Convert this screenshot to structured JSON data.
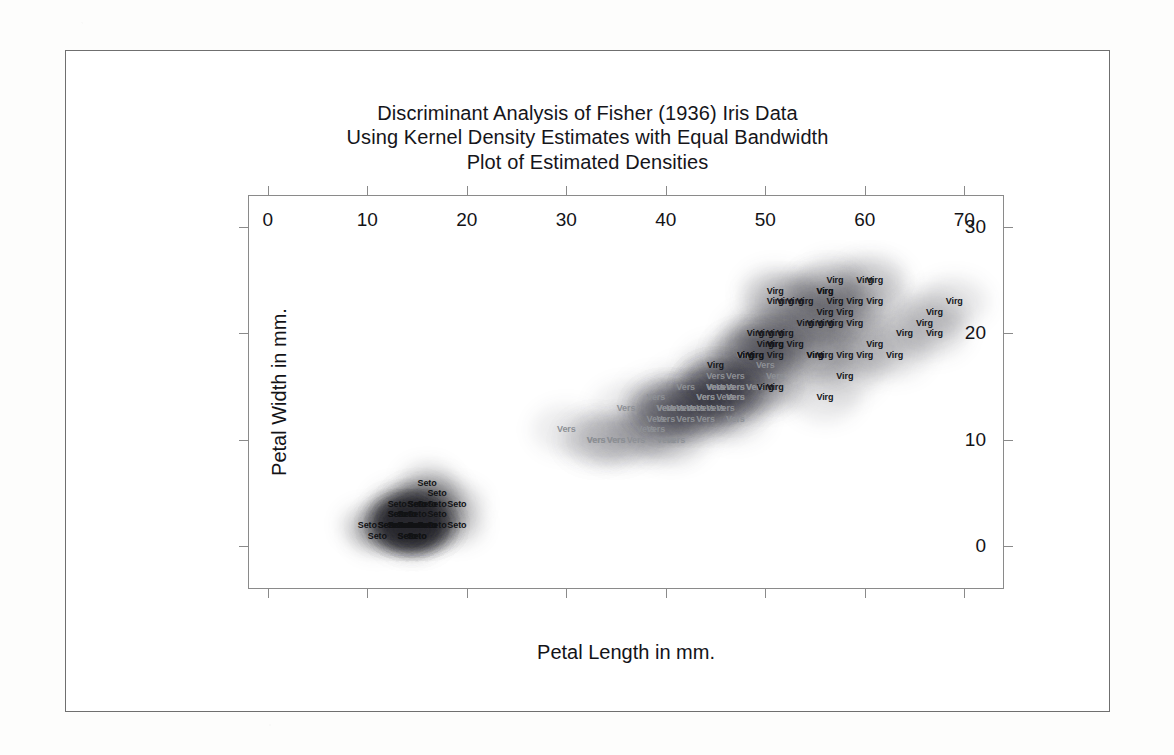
{
  "figure": {
    "title_lines": [
      "Discriminant Analysis of Fisher (1936) Iris Data",
      "Using Kernel Density Estimates with Equal Bandwidth",
      "Plot of Estimated Densities"
    ]
  },
  "chart_data": {
    "type": "scatter",
    "title": "Discriminant Analysis of Fisher (1936) Iris Data\nUsing Kernel Density Estimates with Equal Bandwidth\nPlot of Estimated Densities",
    "xlabel": "Petal Length in mm.",
    "ylabel": "Petal Width in mm.",
    "xlim": [
      -2,
      74
    ],
    "ylim": [
      -4,
      33
    ],
    "xticks": [
      0,
      10,
      20,
      30,
      40,
      50,
      60,
      70
    ],
    "yticks": [
      0,
      10,
      20,
      30
    ],
    "grid": false,
    "legend_position": "none",
    "colors": {
      "setosa": "#111214",
      "versicolor": "#8d9095",
      "virginica": "#15161a",
      "axis": "#8a8a8a",
      "frame": "#6f6f6f",
      "text": "#131317",
      "page": "#ffffff"
    },
    "series": [
      {
        "name": "Setosa",
        "label": "Seto",
        "color": "#111214",
        "points": [
          [
            14,
            2
          ],
          [
            14,
            2
          ],
          [
            13,
            2
          ],
          [
            15,
            2
          ],
          [
            14,
            2
          ],
          [
            17,
            4
          ],
          [
            14,
            3
          ],
          [
            15,
            2
          ],
          [
            14,
            2
          ],
          [
            15,
            1
          ],
          [
            15,
            2
          ],
          [
            16,
            2
          ],
          [
            14,
            1
          ],
          [
            11,
            1
          ],
          [
            12,
            2
          ],
          [
            15,
            4
          ],
          [
            13,
            4
          ],
          [
            14,
            3
          ],
          [
            17,
            3
          ],
          [
            15,
            3
          ],
          [
            17,
            2
          ],
          [
            15,
            4
          ],
          [
            10,
            2
          ],
          [
            17,
            5
          ],
          [
            19,
            2
          ],
          [
            16,
            2
          ],
          [
            16,
            4
          ],
          [
            15,
            2
          ],
          [
            14,
            2
          ],
          [
            16,
            2
          ],
          [
            16,
            2
          ],
          [
            15,
            4
          ],
          [
            15,
            1
          ],
          [
            14,
            2
          ],
          [
            15,
            2
          ],
          [
            12,
            2
          ],
          [
            13,
            2
          ],
          [
            14,
            1
          ],
          [
            13,
            2
          ],
          [
            15,
            2
          ],
          [
            13,
            3
          ],
          [
            13,
            3
          ],
          [
            13,
            2
          ],
          [
            16,
            6
          ],
          [
            19,
            4
          ],
          [
            14,
            3
          ],
          [
            16,
            2
          ],
          [
            14,
            2
          ],
          [
            15,
            2
          ],
          [
            14,
            2
          ]
        ]
      },
      {
        "name": "Versicolor",
        "label": "Vers",
        "color": "#8d9095",
        "points": [
          [
            47,
            14
          ],
          [
            45,
            15
          ],
          [
            49,
            15
          ],
          [
            40,
            13
          ],
          [
            46,
            15
          ],
          [
            45,
            13
          ],
          [
            47,
            16
          ],
          [
            33,
            10
          ],
          [
            46,
            13
          ],
          [
            39,
            14
          ],
          [
            35,
            10
          ],
          [
            42,
            15
          ],
          [
            40,
            10
          ],
          [
            47,
            15
          ],
          [
            36,
            13
          ],
          [
            44,
            14
          ],
          [
            45,
            15
          ],
          [
            41,
            10
          ],
          [
            45,
            15
          ],
          [
            39,
            11
          ],
          [
            48,
            18
          ],
          [
            40,
            13
          ],
          [
            49,
            15
          ],
          [
            47,
            12
          ],
          [
            43,
            13
          ],
          [
            44,
            14
          ],
          [
            47,
            14
          ],
          [
            50,
            17
          ],
          [
            45,
            15
          ],
          [
            35,
            10
          ],
          [
            38,
            11
          ],
          [
            37,
            10
          ],
          [
            39,
            12
          ],
          [
            51,
            16
          ],
          [
            45,
            15
          ],
          [
            45,
            16
          ],
          [
            47,
            15
          ],
          [
            44,
            13
          ],
          [
            41,
            13
          ],
          [
            40,
            13
          ],
          [
            44,
            12
          ],
          [
            46,
            14
          ],
          [
            40,
            12
          ],
          [
            33,
            10
          ],
          [
            42,
            13
          ],
          [
            42,
            12
          ],
          [
            42,
            13
          ],
          [
            43,
            13
          ],
          [
            30,
            11
          ],
          [
            41,
            13
          ]
        ]
      },
      {
        "name": "Virginica",
        "label": "Virg",
        "color": "#15161a",
        "points": [
          [
            60,
            25
          ],
          [
            51,
            19
          ],
          [
            59,
            21
          ],
          [
            56,
            18
          ],
          [
            58,
            22
          ],
          [
            66,
            21
          ],
          [
            45,
            17
          ],
          [
            63,
            18
          ],
          [
            58,
            18
          ],
          [
            61,
            25
          ],
          [
            51,
            20
          ],
          [
            53,
            19
          ],
          [
            55,
            21
          ],
          [
            50,
            20
          ],
          [
            51,
            24
          ],
          [
            53,
            23
          ],
          [
            55,
            18
          ],
          [
            67,
            22
          ],
          [
            69,
            23
          ],
          [
            50,
            15
          ],
          [
            57,
            23
          ],
          [
            49,
            20
          ],
          [
            67,
            20
          ],
          [
            49,
            18
          ],
          [
            57,
            21
          ],
          [
            60,
            18
          ],
          [
            48,
            18
          ],
          [
            49,
            18
          ],
          [
            56,
            21
          ],
          [
            58,
            16
          ],
          [
            61,
            19
          ],
          [
            64,
            20
          ],
          [
            56,
            22
          ],
          [
            51,
            15
          ],
          [
            56,
            14
          ],
          [
            61,
            23
          ],
          [
            56,
            24
          ],
          [
            55,
            18
          ],
          [
            48,
            18
          ],
          [
            54,
            21
          ],
          [
            56,
            24
          ],
          [
            51,
            23
          ],
          [
            51,
            19
          ],
          [
            59,
            23
          ],
          [
            57,
            25
          ],
          [
            52,
            23
          ],
          [
            50,
            19
          ],
          [
            52,
            20
          ],
          [
            54,
            23
          ],
          [
            51,
            18
          ]
        ]
      }
    ]
  },
  "axes": {
    "x": {
      "label": "Petal Length in mm.",
      "tick_labels": [
        "0",
        "10",
        "20",
        "30",
        "40",
        "50",
        "60",
        "70"
      ]
    },
    "y": {
      "label": "Petal Width in mm.",
      "tick_labels": [
        "0",
        "10",
        "20",
        "30"
      ]
    }
  }
}
